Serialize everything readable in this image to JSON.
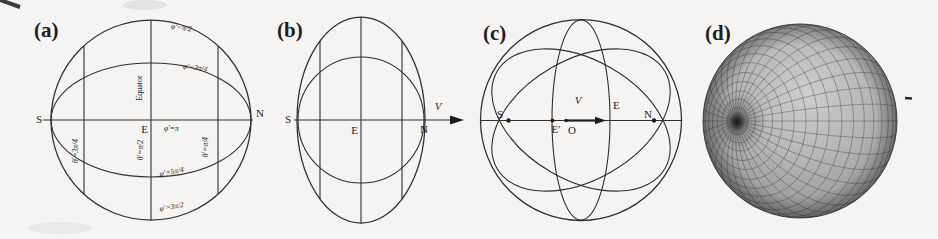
{
  "panels": [
    {
      "label": "(a)",
      "texts": {
        "S": "S",
        "E": "E",
        "N": "N",
        "equator": "Equator",
        "phi_pi2": "φ′=π/2",
        "phi_3pi4": "φ′=3π/4",
        "phi_pi": "φ′=π",
        "phi_5pi4": "φ′=5π/4",
        "phi_3pi2": "φ′=3π/2",
        "theta_3pi4": "θ′=3π/4",
        "theta_pi2": "θ′=π/2",
        "theta_pi4": "θ′=π/4"
      }
    },
    {
      "label": "(b)",
      "texts": {
        "S": "S",
        "E": "E",
        "N": "N",
        "V": "V"
      }
    },
    {
      "label": "(c)",
      "texts": {
        "S": "S",
        "E_prime": "E′",
        "O": "O",
        "V": "V",
        "E": "E",
        "N": "N"
      }
    },
    {
      "label": "(d)",
      "texts": {}
    }
  ]
}
